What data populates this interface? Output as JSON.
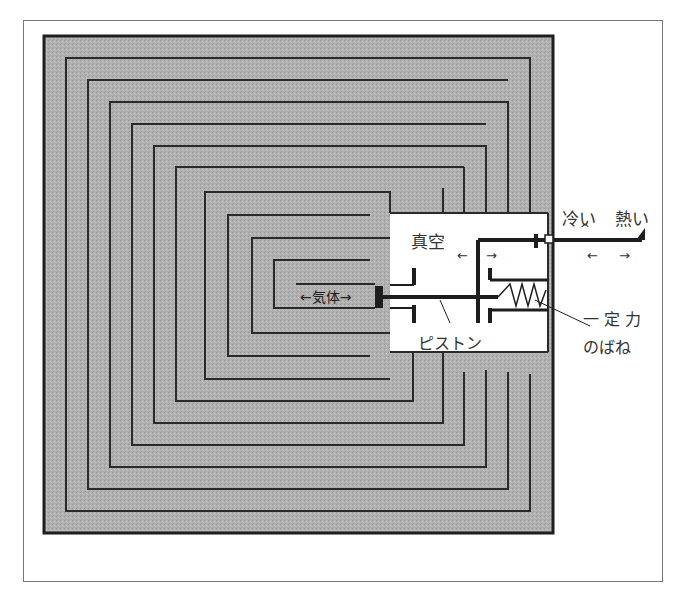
{
  "diagram": {
    "type": "thermal-labyrinth-mechanism",
    "labels": {
      "vacuum": "真空",
      "gas": "←気体→",
      "piston": "ピストン",
      "cold": "冷い",
      "hot": "熱い",
      "constant_force": "一 定 力",
      "spring": "のばね",
      "arrow_left": "←",
      "arrow_right": "→",
      "caret": "^"
    },
    "colors": {
      "fill_gray": "#b3b3b3",
      "line_dark": "#2a2a2a",
      "frame": "#777777",
      "background": "#ffffff"
    }
  }
}
